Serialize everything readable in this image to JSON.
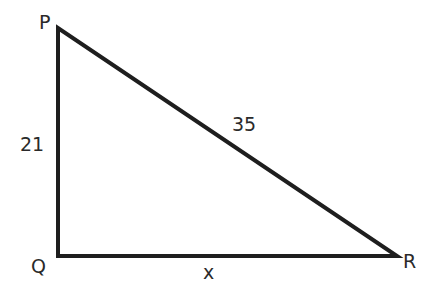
{
  "diagram": {
    "type": "right-triangle",
    "vertices": [
      {
        "id": "P",
        "label": "P",
        "x": 58,
        "y": 28
      },
      {
        "id": "Q",
        "label": "Q",
        "x": 58,
        "y": 256
      },
      {
        "id": "R",
        "label": "R",
        "x": 397,
        "y": 256
      }
    ],
    "sides": [
      {
        "from": "P",
        "to": "Q",
        "label": "21"
      },
      {
        "from": "P",
        "to": "R",
        "label": "35"
      },
      {
        "from": "Q",
        "to": "R",
        "label": "x"
      }
    ],
    "right_angle_at": "Q",
    "stroke_color": "#1e1e1e",
    "background": "#ffffff"
  }
}
